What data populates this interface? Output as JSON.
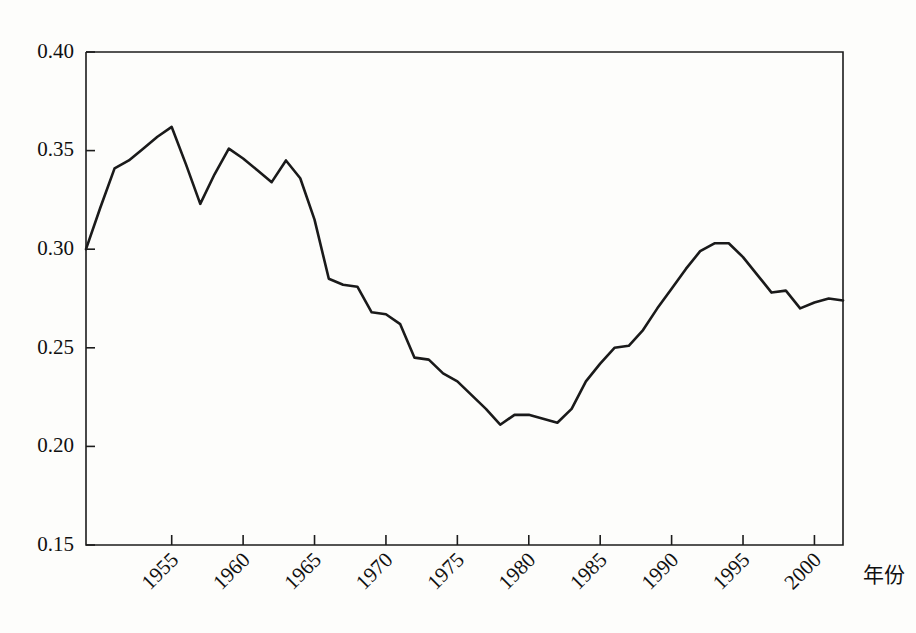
{
  "chart_data": {
    "type": "line",
    "title": "",
    "subtitle": "",
    "xlabel": "年份",
    "ylabel": "",
    "xlim": [
      1949,
      2002
    ],
    "ylim": [
      0.15,
      0.4
    ],
    "grid": false,
    "legend": null,
    "y_ticks": [
      "0.15",
      "0.20",
      "0.25",
      "0.30",
      "0.35",
      "0.40"
    ],
    "y_tick_values": [
      0.15,
      0.2,
      0.25,
      0.3,
      0.35,
      0.4
    ],
    "x_ticks": [
      "1955",
      "1960",
      "1965",
      "1970",
      "1975",
      "1980",
      "1985",
      "1990",
      "1995",
      "2000"
    ],
    "x_tick_values": [
      1955,
      1960,
      1965,
      1970,
      1975,
      1980,
      1985,
      1990,
      1995,
      2000
    ],
    "x_tick_rotation": -45,
    "line_color": "#1a1a1a",
    "axis_color": "#1c1c1c",
    "background_color": "#fdfdfb",
    "series": [
      {
        "name": "",
        "x": [
          1949,
          1950,
          1951,
          1952,
          1953,
          1954,
          1955,
          1956,
          1957,
          1958,
          1959,
          1960,
          1961,
          1962,
          1963,
          1964,
          1965,
          1966,
          1967,
          1968,
          1969,
          1970,
          1971,
          1972,
          1973,
          1974,
          1975,
          1976,
          1977,
          1978,
          1979,
          1980,
          1981,
          1982,
          1983,
          1984,
          1985,
          1986,
          1987,
          1988,
          1989,
          1990,
          1991,
          1992,
          1993,
          1994,
          1995,
          1996,
          1997,
          1998,
          1999,
          2000,
          2001,
          2002
        ],
        "values": [
          0.3,
          0.321,
          0.341,
          0.345,
          0.351,
          0.357,
          0.362,
          0.343,
          0.323,
          0.338,
          0.351,
          0.346,
          0.34,
          0.334,
          0.345,
          0.336,
          0.315,
          0.285,
          0.282,
          0.281,
          0.268,
          0.267,
          0.262,
          0.245,
          0.244,
          0.237,
          0.233,
          0.226,
          0.219,
          0.211,
          0.216,
          0.216,
          0.214,
          0.212,
          0.219,
          0.233,
          0.242,
          0.25,
          0.251,
          0.259,
          0.27,
          0.28,
          0.29,
          0.299,
          0.303,
          0.303,
          0.296,
          0.287,
          0.278,
          0.279,
          0.27,
          0.273,
          0.275,
          0.274
        ]
      }
    ]
  }
}
